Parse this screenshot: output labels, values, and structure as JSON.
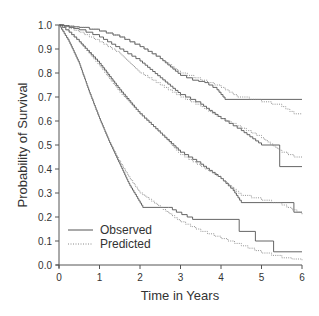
{
  "chart_data": {
    "type": "line",
    "subtype": "step (Kaplan-Meier survival curves)",
    "title": "",
    "xlabel": "Time in Years",
    "ylabel": "Probability of Survival",
    "xlim": [
      0,
      6
    ],
    "ylim": [
      0,
      1.0
    ],
    "xticks": [
      0,
      1,
      2,
      3,
      4,
      5,
      6
    ],
    "xtick_labels": [
      "0",
      "1",
      "2",
      "3",
      "4",
      "5",
      "6"
    ],
    "yticks": [
      0.0,
      0.1,
      0.2,
      0.3,
      0.4,
      0.5,
      0.6,
      0.7,
      0.8,
      0.9,
      1.0
    ],
    "ytick_labels": [
      "0.0",
      "0.1",
      "0.2",
      "0.3",
      "0.4",
      "0.5",
      "0.6",
      "0.7",
      "0.8",
      "0.9",
      "1.0"
    ],
    "grid": false,
    "legend": {
      "position": "lower left",
      "entries": [
        {
          "label": "Observed",
          "style": "solid"
        },
        {
          "label": "Predicted",
          "style": "dotted"
        }
      ]
    },
    "series": [
      {
        "name": "Observed",
        "group": 1,
        "style": "solid",
        "x": [
          0,
          0.25,
          0.5,
          1.0,
          1.5,
          2.0,
          2.5,
          3.0,
          3.3,
          3.6,
          3.9,
          4.1,
          6.0
        ],
        "y": [
          1.0,
          0.995,
          0.99,
          0.975,
          0.95,
          0.91,
          0.86,
          0.79,
          0.77,
          0.76,
          0.73,
          0.69,
          0.69
        ]
      },
      {
        "name": "Predicted",
        "group": 1,
        "style": "dotted",
        "x": [
          0,
          0.25,
          0.5,
          1.0,
          1.5,
          2.0,
          2.5,
          3.0,
          3.5,
          4.0,
          4.4,
          5.0,
          5.5,
          5.8,
          6.0
        ],
        "y": [
          1.0,
          0.995,
          0.99,
          0.975,
          0.95,
          0.91,
          0.86,
          0.8,
          0.77,
          0.74,
          0.7,
          0.68,
          0.66,
          0.63,
          0.63
        ]
      },
      {
        "name": "Observed",
        "group": 2,
        "style": "solid",
        "x": [
          0,
          0.25,
          0.5,
          1.0,
          1.5,
          2.0,
          2.5,
          3.0,
          3.5,
          4.0,
          4.5,
          5.0,
          5.45,
          5.45,
          6.0
        ],
        "y": [
          1.0,
          0.99,
          0.98,
          0.95,
          0.9,
          0.85,
          0.78,
          0.71,
          0.67,
          0.61,
          0.56,
          0.5,
          0.5,
          0.41,
          0.41
        ]
      },
      {
        "name": "Predicted",
        "group": 2,
        "style": "dotted",
        "x": [
          0,
          0.25,
          0.5,
          1.0,
          1.5,
          2.0,
          2.5,
          3.0,
          3.5,
          4.0,
          4.5,
          5.0,
          5.5,
          5.8,
          6.0
        ],
        "y": [
          1.0,
          0.985,
          0.97,
          0.93,
          0.88,
          0.8,
          0.75,
          0.7,
          0.66,
          0.61,
          0.57,
          0.53,
          0.47,
          0.45,
          0.45
        ]
      },
      {
        "name": "Observed",
        "group": 3,
        "style": "solid",
        "x": [
          0,
          0.25,
          0.5,
          1.0,
          1.5,
          2.0,
          2.5,
          3.0,
          3.5,
          4.0,
          4.3,
          4.5,
          5.8,
          5.8,
          6.0
        ],
        "y": [
          1.0,
          0.97,
          0.93,
          0.84,
          0.73,
          0.63,
          0.55,
          0.47,
          0.42,
          0.36,
          0.31,
          0.26,
          0.26,
          0.22,
          0.22
        ]
      },
      {
        "name": "Predicted",
        "group": 3,
        "style": "dotted",
        "x": [
          0,
          0.25,
          0.5,
          1.0,
          1.5,
          2.0,
          2.5,
          3.0,
          3.5,
          4.0,
          4.5,
          5.0,
          5.5,
          6.0
        ],
        "y": [
          1.0,
          0.97,
          0.93,
          0.83,
          0.72,
          0.63,
          0.55,
          0.46,
          0.41,
          0.36,
          0.29,
          0.27,
          0.25,
          0.21
        ]
      },
      {
        "name": "Observed",
        "group": 4,
        "style": "solid",
        "x": [
          0,
          0.25,
          0.5,
          0.75,
          1.0,
          1.25,
          1.5,
          1.75,
          2.07,
          2.07,
          2.7,
          2.9,
          3.3,
          3.3,
          4.45,
          4.45,
          4.85,
          4.85,
          5.3,
          5.3,
          6.0
        ],
        "y": [
          1.0,
          0.93,
          0.84,
          0.72,
          0.61,
          0.51,
          0.42,
          0.33,
          0.24,
          0.24,
          0.24,
          0.22,
          0.19,
          0.19,
          0.19,
          0.14,
          0.14,
          0.1,
          0.1,
          0.055,
          0.055
        ]
      },
      {
        "name": "Predicted",
        "group": 4,
        "style": "dotted",
        "x": [
          0,
          0.25,
          0.5,
          0.75,
          1.0,
          1.25,
          1.5,
          1.75,
          2.0,
          2.5,
          3.0,
          3.5,
          4.0,
          4.5,
          5.0,
          5.5,
          6.0
        ],
        "y": [
          1.0,
          0.93,
          0.84,
          0.72,
          0.61,
          0.51,
          0.43,
          0.36,
          0.3,
          0.24,
          0.18,
          0.14,
          0.11,
          0.08,
          0.05,
          0.03,
          0.02
        ]
      }
    ]
  },
  "layout": {
    "plot_left": 59,
    "plot_right": 302,
    "plot_top": 25,
    "plot_bottom": 265,
    "line_color": "#555555",
    "dotted_color": "#888888",
    "axis_color": "#555555"
  }
}
